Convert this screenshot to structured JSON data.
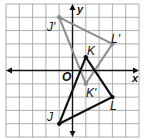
{
  "diagram": {
    "type": "coordinate-plane-transformation",
    "grid": {
      "x_min": -5,
      "x_max": 5,
      "y_min": -5,
      "y_max": 5,
      "cell_px": 13.3,
      "origin_px": [
        72.5,
        70.5
      ],
      "line_color": "#9a9a9a",
      "axis_color": "#111111"
    },
    "axes": {
      "x_label": "x",
      "y_label": "y",
      "origin_label": "O"
    },
    "preimage": {
      "name": "triangle JKL",
      "color": "#111111",
      "vertices": [
        {
          "label": "J",
          "x": -1,
          "y": -4
        },
        {
          "label": "K",
          "x": 1,
          "y": 1
        },
        {
          "label": "L",
          "x": 3,
          "y": -2
        }
      ]
    },
    "image": {
      "name": "triangle J'K'L'",
      "color": "#8c8c8c",
      "vertices": [
        {
          "label": "J'",
          "x": -1,
          "y": 4
        },
        {
          "label": "K'",
          "x": 1,
          "y": -1
        },
        {
          "label": "L'",
          "x": 3,
          "y": 2
        }
      ]
    }
  }
}
